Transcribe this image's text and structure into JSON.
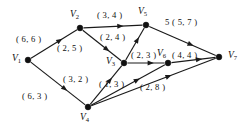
{
  "figure": {
    "type": "directed-network-flow-graph",
    "background_color": "#ffffff",
    "ink_color": "#101010",
    "width": 243,
    "height": 130
  },
  "nodes": [
    {
      "id": "V1",
      "label": "V",
      "sub": "1",
      "x": 28,
      "y": 60,
      "label_x": 12,
      "label_y": 54
    },
    {
      "id": "V2",
      "label": "V",
      "sub": "2",
      "x": 80,
      "y": 28,
      "label_x": 70,
      "label_y": 10
    },
    {
      "id": "V3",
      "label": "V",
      "sub": "3",
      "x": 124,
      "y": 63,
      "label_x": 106,
      "label_y": 57
    },
    {
      "id": "V4",
      "label": "V",
      "sub": "4",
      "x": 88,
      "y": 107,
      "label_x": 80,
      "label_y": 113
    },
    {
      "id": "V5",
      "label": "V",
      "sub": "5",
      "x": 146,
      "y": 25,
      "label_x": 138,
      "label_y": 7
    },
    {
      "id": "V6",
      "label": "V",
      "sub": "6",
      "x": 168,
      "y": 63,
      "label_x": 157,
      "label_y": 49
    },
    {
      "id": "V7",
      "label": "V",
      "sub": "7",
      "x": 219,
      "y": 57,
      "label_x": 228,
      "label_y": 51
    }
  ],
  "edges": [
    {
      "id": "e1",
      "from": "V1",
      "to": "V2",
      "label": "( 6, 6 )",
      "label_x": 16,
      "label_y": 35
    },
    {
      "id": "e2",
      "from": "V1",
      "to": "V4",
      "label": "( 6, 3 )",
      "label_x": 22,
      "label_y": 92
    },
    {
      "id": "e3",
      "from": "V2",
      "to": "V5",
      "label": "( 3, 4 )",
      "label_x": 97,
      "label_y": 11
    },
    {
      "id": "e4",
      "from": "V2",
      "to": "V3",
      "label": "( 2, 5 )",
      "label_x": 57,
      "label_y": 44
    },
    {
      "id": "e5",
      "from": "V3",
      "to": "V5",
      "label": "( 2, 4 )",
      "label_x": 100,
      "label_y": 33
    },
    {
      "id": "e6",
      "from": "V4",
      "to": "V3",
      "label": "( 3, 2 )",
      "label_x": 63,
      "label_y": 75
    },
    {
      "id": "e7",
      "from": "V3",
      "to": "V6",
      "label": "( 2, 3 )",
      "label_x": 131,
      "label_y": 51
    },
    {
      "id": "e8",
      "from": "V5",
      "to": "V7",
      "label": "5  ( 5, 7 )",
      "label_x": 165,
      "label_y": 18
    },
    {
      "id": "e9",
      "from": "V6",
      "to": "V7",
      "label": "( 4, 4 )",
      "label_x": 172,
      "label_y": 51
    },
    {
      "id": "e10",
      "from": "V4",
      "to": "V6",
      "label": "( 1, 3 )",
      "label_x": 99,
      "label_y": 80
    },
    {
      "id": "e11",
      "from": "V4",
      "to": "V7",
      "label": "( 2, 8 )",
      "label_x": 140,
      "label_y": 83
    }
  ]
}
